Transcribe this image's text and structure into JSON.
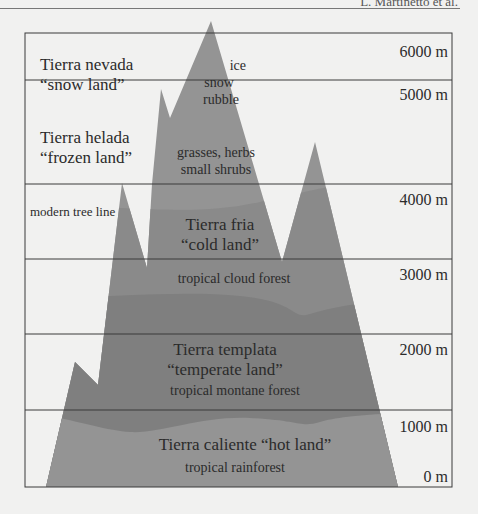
{
  "header": {
    "running_head": "L. Martinetto et al."
  },
  "colors": {
    "background": "#f1f1f0",
    "mountain_light": "#949494",
    "mountain_mid": "#8a8a8a",
    "mountain_dark": "#7f7f7f",
    "grid_line": "#3a3a3a",
    "text": "#2b2b2b"
  },
  "frame": {
    "left": 25,
    "right": 452,
    "top": 33,
    "bottom": 487
  },
  "gridlines_y": [
    80,
    184,
    259,
    334,
    410
  ],
  "altitude_labels": [
    {
      "text": "6000 m",
      "y": 57
    },
    {
      "text": "5000 m",
      "y": 100
    },
    {
      "text": "4000 m",
      "y": 205
    },
    {
      "text": "3000 m",
      "y": 280
    },
    {
      "text": "2000 m",
      "y": 355
    },
    {
      "text": "1000 m",
      "y": 432
    },
    {
      "text": "0 m",
      "y": 482
    }
  ],
  "zones": [
    {
      "name": "Tierra nevada",
      "gloss": "“snow land”",
      "x": 40,
      "y1": 70,
      "y2": 90,
      "anchor": "start",
      "size": 17
    },
    {
      "name": "Tierra helada",
      "gloss": "“frozen land”",
      "x": 40,
      "y1": 143,
      "y2": 163,
      "anchor": "start",
      "size": 17
    },
    {
      "name": "Tierra fria",
      "gloss": "“cold land”",
      "x": 220,
      "y1": 230,
      "y2": 250,
      "anchor": "middle",
      "size": 17
    },
    {
      "name": "Tierra templata",
      "gloss": "“temperate land”",
      "x": 225,
      "y1": 355,
      "y2": 375,
      "anchor": "middle",
      "size": 17
    },
    {
      "name": "Tierra caliente “hot land”",
      "gloss": "",
      "x": 245,
      "y1": 450,
      "y2": 0,
      "anchor": "middle",
      "size": 17
    }
  ],
  "vegetation": [
    {
      "text": "ice",
      "x": 246,
      "y": 70,
      "anchor": "end"
    },
    {
      "text": "snow",
      "x": 219,
      "y": 87,
      "anchor": "middle"
    },
    {
      "text": "rubble",
      "x": 221,
      "y": 104,
      "anchor": "middle"
    },
    {
      "text": "grasses, herbs",
      "x": 216,
      "y": 157,
      "anchor": "middle"
    },
    {
      "text": "small shrubs",
      "x": 216,
      "y": 174,
      "anchor": "middle"
    },
    {
      "text": "modern tree line",
      "x": 30,
      "y": 216,
      "anchor": "start"
    },
    {
      "text": "tropical cloud forest",
      "x": 234,
      "y": 283,
      "anchor": "middle"
    },
    {
      "text": "tropical montane forest",
      "x": 235,
      "y": 395,
      "anchor": "middle"
    },
    {
      "text": "tropical rainforest",
      "x": 235,
      "y": 472,
      "anchor": "middle"
    }
  ],
  "mountain": {
    "outline": "46,487 75,362 98,385 122,183 147,268 152,184 161,89 170,118 211,21 282,262 315,142 398,487",
    "upper_band_clip_y": 210,
    "middle_band_y": 300,
    "lower_band_y": 420
  }
}
